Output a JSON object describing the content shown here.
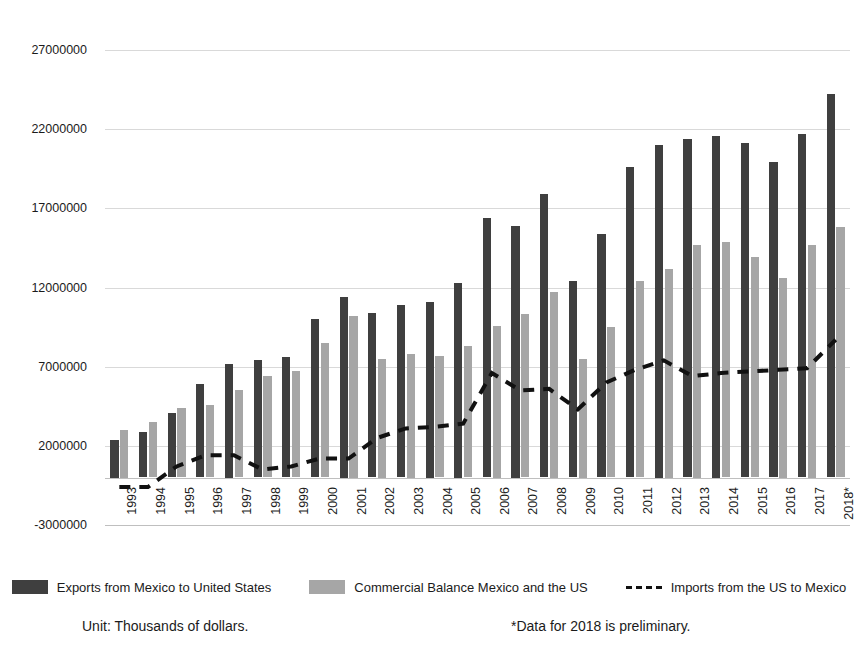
{
  "chart_data": {
    "type": "bar",
    "title": "",
    "xlabel": "",
    "ylabel": "",
    "ylim": [
      -3000000,
      27000000
    ],
    "grid": true,
    "legend_position": "bottom",
    "unit_note": "Unit: Thousands of dollars.",
    "preliminary_note": "*Data for 2018 is preliminary.",
    "y_ticks": [
      "27000000",
      "22000000",
      "17000000",
      "12000000",
      "7000000",
      "2000000",
      "-3000000"
    ],
    "y_tick_values": [
      27000000,
      22000000,
      17000000,
      12000000,
      7000000,
      2000000,
      -3000000
    ],
    "categories": [
      "1993",
      "1994",
      "1995",
      "1996",
      "1997",
      "1998",
      "1999",
      "2000",
      "2001",
      "2002",
      "2003",
      "2004",
      "2005",
      "2006",
      "2007",
      "2008",
      "2009",
      "2010",
      "2011",
      "2012",
      "2013",
      "2014",
      "2015",
      "2016",
      "2017",
      "2018*"
    ],
    "series": [
      {
        "name": "Exports from Mexico to United States",
        "type": "bar",
        "color": "#3f3f3f",
        "values": [
          2400000,
          2900000,
          4100000,
          5900000,
          7200000,
          7400000,
          7600000,
          10000000,
          11400000,
          10400000,
          10900000,
          11100000,
          12300000,
          16400000,
          15900000,
          17900000,
          12400000,
          15400000,
          19600000,
          21000000,
          21400000,
          21600000,
          21100000,
          19900000,
          21700000,
          24200000
        ]
      },
      {
        "name": "Commercial Balance Mexico and the US",
        "type": "bar",
        "color": "#a6a6a6",
        "values": [
          3000000,
          3500000,
          4400000,
          4600000,
          5500000,
          6400000,
          6700000,
          8500000,
          10200000,
          7500000,
          7800000,
          7700000,
          8300000,
          9600000,
          10300000,
          11700000,
          7500000,
          9500000,
          12400000,
          13200000,
          14700000,
          14900000,
          13900000,
          12600000,
          14700000,
          15800000
        ]
      },
      {
        "name": "Imports from the US to Mexico",
        "type": "line",
        "style": "dashed",
        "color": "#111111",
        "values": [
          -600000,
          -600000,
          700000,
          1400000,
          1400000,
          500000,
          700000,
          1200000,
          1200000,
          2500000,
          3100000,
          3200000,
          3400000,
          6600000,
          5500000,
          5600000,
          4300000,
          6000000,
          6800000,
          7400000,
          6400000,
          6600000,
          6700000,
          6800000,
          6900000,
          8700000
        ]
      }
    ]
  },
  "legend": [
    {
      "label": "Exports from Mexico to United States",
      "marker": "bar-dark-swatch"
    },
    {
      "label": "Commercial Balance Mexico and the US",
      "marker": "bar-gray-swatch"
    },
    {
      "label": "Imports from the US to Mexico",
      "marker": "dashed-line-swatch"
    }
  ],
  "notes": {
    "unit": "Unit: Thousands of dollars.",
    "preliminary": "*Data for 2018 is preliminary."
  },
  "colors": {
    "exports": "#3f3f3f",
    "balance": "#a6a6a6",
    "imports_line": "#111111",
    "gridline": "#d9d9d9",
    "text": "#1b1b1b",
    "background": "#ffffff"
  }
}
